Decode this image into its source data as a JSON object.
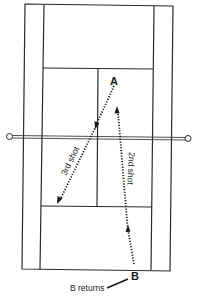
{
  "diagram": {
    "title": "",
    "players": {
      "a": "A",
      "b": "B"
    },
    "shots": [
      {
        "id": "2nd",
        "label": "2nd shot",
        "from": "B",
        "to": "near-A"
      },
      {
        "id": "3rd",
        "label": "3rd shot",
        "from": "A",
        "to": "cross-court deep"
      }
    ],
    "callout": "B returns",
    "colors": {
      "line": "#2a2a2a",
      "background": "#ffffff"
    }
  }
}
